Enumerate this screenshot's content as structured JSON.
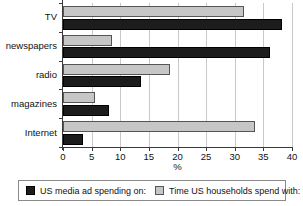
{
  "chart_data": {
    "type": "bar",
    "orientation": "horizontal",
    "title": "",
    "xlabel": "%",
    "ylabel": "",
    "xlim": [
      0,
      40
    ],
    "xticks": [
      0,
      5,
      10,
      15,
      20,
      25,
      30,
      35,
      40
    ],
    "xtick_labels": [
      "0",
      "5",
      "10",
      "15",
      "20",
      "25",
      "30",
      "35",
      "40"
    ],
    "grid": true,
    "legend_position": "bottom",
    "categories": [
      "TV",
      "newspapers",
      "radio",
      "magazines",
      "Internet"
    ],
    "series": [
      {
        "name": "US media ad spending on:",
        "color": "#1c1c1c",
        "swatch": "black",
        "values": [
          38.3,
          36.1,
          13.7,
          8.0,
          3.5
        ]
      },
      {
        "name": "Time US households spend with:",
        "color": "#c6c6c6",
        "swatch": "gray",
        "values": [
          31.6,
          8.6,
          18.7,
          5.6,
          33.6
        ]
      }
    ]
  },
  "legend": {
    "entries": [
      {
        "label": "US media ad spending on:",
        "swatch": "black"
      },
      {
        "label": "Time US households spend with:",
        "swatch": "gray"
      }
    ]
  },
  "colors": {
    "series_ad_spending": "#1c1c1c",
    "series_household_time": "#c6c6c6",
    "axis": "#3a3a3a",
    "gridline": "#c9c9c9",
    "background": "#ffffff"
  }
}
